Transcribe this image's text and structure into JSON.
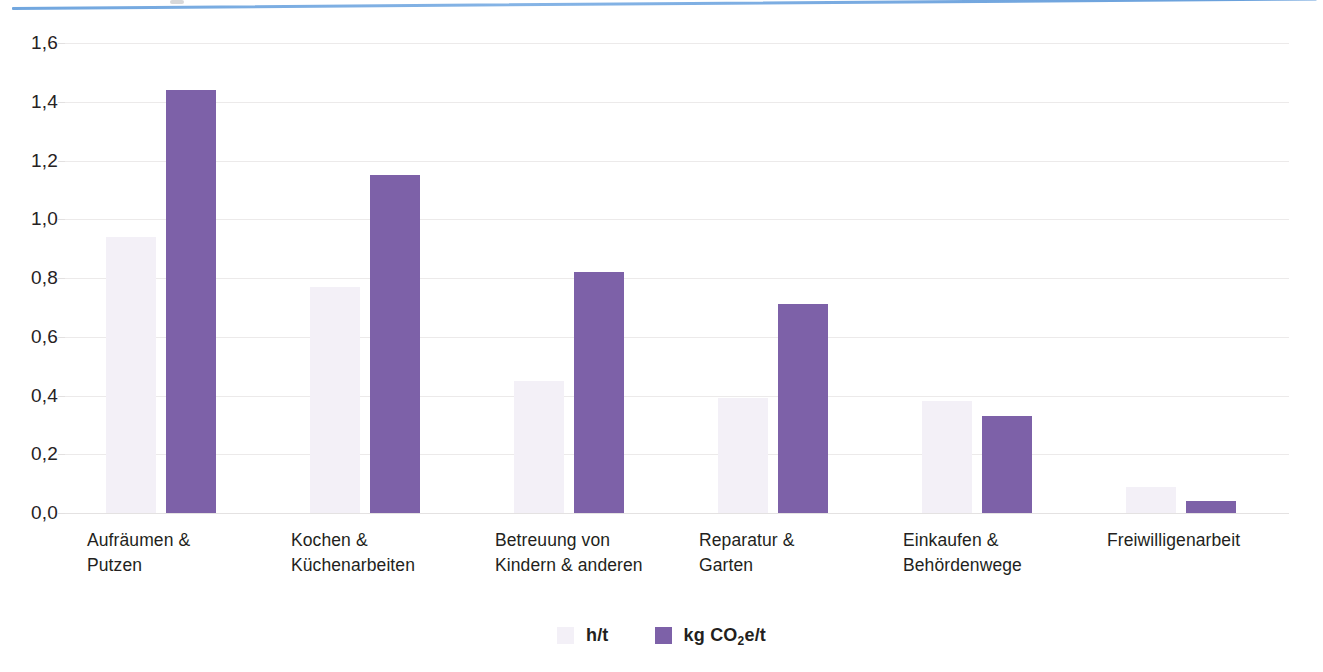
{
  "decor": {
    "top_rule_color": "#6fa4de"
  },
  "legend": {
    "position": "bottom-center",
    "items": [
      {
        "label_prefix": "h/t",
        "label_sub": "",
        "label_suffix": "",
        "color": "#f3f0f7",
        "swatch_name": "legend-swatch-ht"
      },
      {
        "label_prefix": "kg CO",
        "label_sub": "2",
        "label_suffix": "e/t",
        "color": "#7d61a8",
        "swatch_name": "legend-swatch-co2"
      }
    ]
  },
  "chart_data": {
    "type": "bar",
    "title": "",
    "subtitle": "",
    "xlabel": "",
    "ylabel": "",
    "ylim": [
      0,
      1.6
    ],
    "ytick_step": 0.2,
    "grid": true,
    "decimal_separator": ",",
    "legend_position": "bottom-center",
    "ytick_labels": [
      "1,6",
      "1,4",
      "1,2",
      "1,0",
      "0,8",
      "0,6",
      "0,4",
      "0,2",
      "0,0"
    ],
    "ytick_values": [
      1.6,
      1.4,
      1.2,
      1.0,
      0.8,
      0.6,
      0.4,
      0.2,
      0.0
    ],
    "categories": [
      "Aufräumen &\nPutzen",
      "Kochen &\nKüchenarbeiten",
      "Betreuung von\nKindern & anderen",
      "Reparatur &\nGarten",
      "Einkaufen &\nBehördenwege",
      "Freiwilligenarbeit"
    ],
    "series": [
      {
        "name": "h/t",
        "color": "#f3f0f7",
        "values": [
          0.94,
          0.77,
          0.45,
          0.39,
          0.38,
          0.09
        ]
      },
      {
        "name": "kg CO2e/t",
        "color": "#7d61a8",
        "values": [
          1.44,
          1.15,
          0.82,
          0.71,
          0.33,
          0.04
        ]
      }
    ]
  }
}
